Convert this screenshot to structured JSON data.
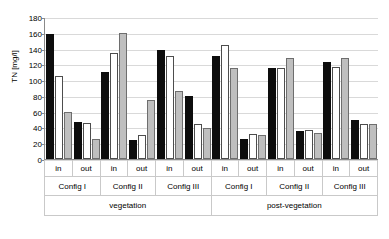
{
  "chart_data": {
    "type": "bar",
    "title": "",
    "xlabel": "",
    "ylabel": "TN [mg/l]",
    "ylim": [
      0,
      180
    ],
    "ytick_step": 20,
    "yticks": [
      180,
      160,
      140,
      120,
      100,
      80,
      60,
      40,
      20,
      0
    ],
    "grid": true,
    "legend": "none",
    "categories": [
      "vegetation / Config I / in",
      "vegetation / Config I / out",
      "vegetation / Config II / in",
      "vegetation / Config II / out",
      "vegetation / Config III / in",
      "vegetation / Config III / out",
      "post-vegetation / Config I / in",
      "post-vegetation / Config I / out",
      "post-vegetation / Config II / in",
      "post-vegetation / Config II / out",
      "post-vegetation / Config III / in",
      "post-vegetation / Config III / out"
    ],
    "series": [
      {
        "name": "series-1",
        "color": "#0d0d0d",
        "values": [
          158,
          47,
          110,
          24,
          138,
          80,
          130,
          25,
          115,
          35,
          123,
          50
        ]
      },
      {
        "name": "series-2",
        "color": "#ffffff",
        "values": [
          105,
          46,
          134,
          30,
          130,
          45,
          145,
          32,
          116,
          37,
          117,
          45
        ]
      },
      {
        "name": "series-3",
        "color": "#bfbfbf",
        "values": [
          59,
          26,
          160,
          75,
          86,
          39,
          115,
          30,
          128,
          33,
          128,
          45
        ]
      }
    ]
  },
  "axis": {
    "tier_inout": [
      "in",
      "out",
      "in",
      "out",
      "in",
      "out",
      "in",
      "out",
      "in",
      "out",
      "in",
      "out"
    ],
    "tier_config": [
      "Config I",
      "Config II",
      "Config III",
      "Config I",
      "Config II",
      "Config III"
    ],
    "tier_phase": [
      "vegetation",
      "post-vegetation"
    ]
  }
}
